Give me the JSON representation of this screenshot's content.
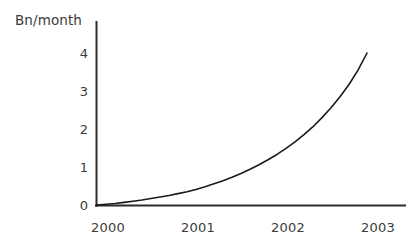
{
  "chart_data": {
    "type": "line",
    "title": "",
    "subtitle": "",
    "xlabel": "",
    "ylabel": "Bn/month",
    "ylabel_position": "top-left",
    "grid": false,
    "legend": false,
    "legend_position": "none",
    "line_color": "#1a1a1a",
    "axis_color": "#2b2b2b",
    "background_color": "#ffffff",
    "text_color": "#3b3b3b",
    "x_tick_labels": [
      "2000",
      "2001",
      "2002",
      "2003"
    ],
    "x_tick_values": [
      2000,
      2001,
      2002,
      2003
    ],
    "y_tick_labels": [
      "0",
      "1",
      "2",
      "3",
      "4"
    ],
    "y_tick_values": [
      0,
      1,
      2,
      3,
      4
    ],
    "xlim": [
      2000,
      2003.3
    ],
    "ylim": [
      0,
      4.3
    ],
    "series": [
      {
        "name": "Bn/month",
        "x": [
          2000.0,
          2000.1,
          2000.2,
          2000.3,
          2000.4,
          2000.5,
          2000.6,
          2000.7,
          2000.8,
          2000.9,
          2001.0,
          2001.1,
          2001.2,
          2001.3,
          2001.4,
          2001.5,
          2001.6,
          2001.7,
          2001.8,
          2001.9,
          2002.0,
          2002.1,
          2002.2,
          2002.3,
          2002.4,
          2002.5,
          2002.6,
          2002.7,
          2002.8,
          2002.9,
          2003.0
        ],
        "values": [
          0.0,
          0.02,
          0.04,
          0.07,
          0.1,
          0.13,
          0.17,
          0.21,
          0.25,
          0.3,
          0.35,
          0.41,
          0.48,
          0.56,
          0.64,
          0.73,
          0.83,
          0.94,
          1.06,
          1.19,
          1.33,
          1.49,
          1.66,
          1.85,
          2.06,
          2.3,
          2.56,
          2.85,
          3.17,
          3.55,
          4.0
        ]
      }
    ]
  },
  "axis": {
    "y_title": "Bn/month"
  }
}
